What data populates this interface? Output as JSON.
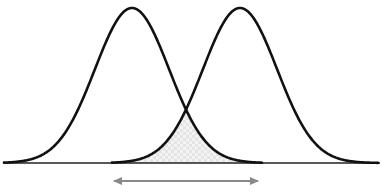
{
  "diagram": {
    "type": "overlapping-normal-distributions",
    "width": 382,
    "height": 192,
    "baseline": {
      "x1": 4,
      "x2": 380,
      "y": 163,
      "color": "#222222"
    },
    "curves": [
      {
        "name": "left-distribution",
        "mean_x": 132,
        "peak_y": 8,
        "sigma": 37,
        "x_start": 4,
        "x_end": 262,
        "color": "#111111"
      },
      {
        "name": "right-distribution",
        "mean_x": 240,
        "peak_y": 8,
        "sigma": 37,
        "x_start": 112,
        "x_end": 378,
        "color": "#111111"
      }
    ],
    "overlap": {
      "x_start": 112,
      "x_end": 262,
      "fill": "#e2e2e2",
      "pattern_alt": "#f2f2f2"
    },
    "arrow": {
      "x1": 114,
      "x2": 258,
      "y": 181,
      "color": "#8a8a8a",
      "bidirectional": true
    }
  }
}
